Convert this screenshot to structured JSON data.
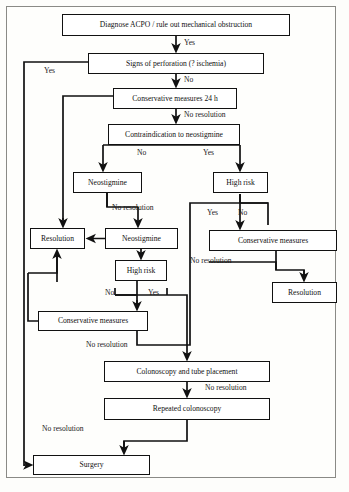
{
  "diagram": {
    "fontsize_node": 7.6,
    "fontsize_label": 7.6,
    "nodes": [
      {
        "id": "diagnose",
        "text": "Diagnose ACPO / rule out mechanical obstruction",
        "x": 62,
        "y": 14,
        "w": 228,
        "h": 22,
        "fs": 7.6
      },
      {
        "id": "perforation",
        "text": "Signs of perforation (? ischemia)",
        "x": 88,
        "y": 53,
        "w": 176,
        "h": 21,
        "fs": 7.6
      },
      {
        "id": "cons24",
        "text": "Conservative measures 24 h",
        "x": 113,
        "y": 88,
        "w": 124,
        "h": 21,
        "fs": 7.6
      },
      {
        "id": "contra",
        "text": "Contraindication to neostigmine",
        "x": 108,
        "y": 124,
        "w": 132,
        "h": 21,
        "fs": 7.6
      },
      {
        "id": "neo1",
        "text": "Neostigmine",
        "x": 73,
        "y": 172,
        "w": 69,
        "h": 21,
        "fs": 7.6
      },
      {
        "id": "highrisk1",
        "text": "High risk",
        "x": 213,
        "y": 172,
        "w": 55,
        "h": 21,
        "fs": 7.6
      },
      {
        "id": "resolution1",
        "text": "Resolution",
        "x": 30,
        "y": 228,
        "w": 55,
        "h": 21,
        "fs": 7.6
      },
      {
        "id": "neo2",
        "text": "Neostigmine",
        "x": 105,
        "y": 228,
        "w": 73,
        "h": 21,
        "fs": 7.6
      },
      {
        "id": "consRight",
        "text": "Conservative measures",
        "x": 209,
        "y": 230,
        "w": 128,
        "h": 21,
        "fs": 7.6
      },
      {
        "id": "highrisk2",
        "text": "High risk",
        "x": 115,
        "y": 260,
        "w": 52,
        "h": 21,
        "fs": 7.6
      },
      {
        "id": "resolution2",
        "text": "Resolution",
        "x": 272,
        "y": 282,
        "w": 65,
        "h": 21,
        "fs": 7.6
      },
      {
        "id": "consBottomLeft",
        "text": "Conservative measures",
        "x": 38,
        "y": 311,
        "w": 110,
        "h": 20,
        "fs": 7.6
      },
      {
        "id": "colonoscopy",
        "text": "Colonoscopy and tube placement",
        "x": 104,
        "y": 361,
        "w": 166,
        "h": 21,
        "fs": 7.6
      },
      {
        "id": "repeatColon",
        "text": "Repeated colonoscopy",
        "x": 104,
        "y": 398,
        "w": 166,
        "h": 22,
        "fs": 7.6
      },
      {
        "id": "surgery",
        "text": "Surgery",
        "x": 33,
        "y": 455,
        "w": 117,
        "h": 20,
        "fs": 7.6
      }
    ],
    "edge_labels": [
      {
        "id": "yes-diagnose",
        "text": "Yes",
        "x": 184,
        "y": 38
      },
      {
        "id": "yes-perforation",
        "text": "Yes",
        "x": 44,
        "y": 66
      },
      {
        "id": "no-perforation",
        "text": "No",
        "x": 184,
        "y": 75
      },
      {
        "id": "nores-cons24",
        "text": "No resolution",
        "x": 184,
        "y": 110
      },
      {
        "id": "no-contra",
        "text": "No",
        "x": 137,
        "y": 148
      },
      {
        "id": "yes-contra",
        "text": "Yes",
        "x": 203,
        "y": 148
      },
      {
        "id": "nores-neo1",
        "text": "No resolution",
        "x": 112,
        "y": 203
      },
      {
        "id": "yes-highrisk1",
        "text": "Yes",
        "x": 207,
        "y": 208
      },
      {
        "id": "no-highrisk1",
        "text": "No",
        "x": 238,
        "y": 208
      },
      {
        "id": "no-highrisk2",
        "text": "No",
        "x": 105,
        "y": 288
      },
      {
        "id": "yes-highrisk2",
        "text": "Yes",
        "x": 148,
        "y": 288
      },
      {
        "id": "nores-consRight",
        "text": "No resolution",
        "x": 190,
        "y": 256
      },
      {
        "id": "nores-consbl",
        "text": "No resolution",
        "x": 86,
        "y": 340
      },
      {
        "id": "nores-colonoscopy",
        "text": "No resolution",
        "x": 205,
        "y": 383
      },
      {
        "id": "nores-repeat",
        "text": "No resolution",
        "x": 42,
        "y": 424
      }
    ],
    "colors": {
      "line": "#111111",
      "box_border": "#111111",
      "box_fill": "#ffffff",
      "frame": "#8a8a86",
      "page": "#fdfdfb"
    }
  }
}
